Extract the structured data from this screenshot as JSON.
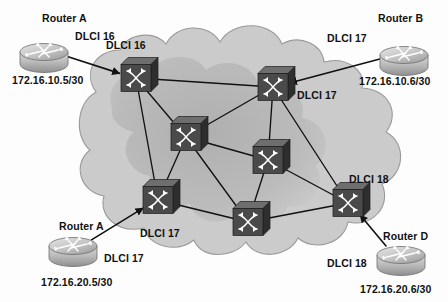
{
  "diagram": {
    "cloud": {
      "name": "frame-relay-cloud",
      "fill_outer": "#c9c9c9",
      "fill_inner": "#a8a8a8",
      "stroke": "#8d8d8d"
    },
    "colors": {
      "switch_face": "#4a4a4a",
      "switch_top": "#6e6e6e",
      "switch_side": "#2e2e2e",
      "switch_glyph": "#ffffff",
      "router_body": "#b4b4b4",
      "router_top": "#d6d6d6",
      "router_glyph": "#ffffff",
      "link": "#111111",
      "text": "#111111"
    },
    "routers": [
      {
        "id": "router-a-top",
        "name": "Router A",
        "dlci": "DLCI 16",
        "address": "172.16.10.5/30",
        "x": 44,
        "y": 52,
        "name_x": 42,
        "name_y": 13,
        "dlci_x": 75,
        "dlci_y": 31,
        "addr_x": 12,
        "addr_y": 75
      },
      {
        "id": "router-b-top",
        "name": "Router B",
        "dlci": "DLCI 17",
        "address": "172.16.10.6/30",
        "x": 404,
        "y": 55,
        "name_x": 378,
        "name_y": 13,
        "dlci_x": 327,
        "dlci_y": 33,
        "addr_x": 359,
        "addr_y": 76
      },
      {
        "id": "router-a-bottom",
        "name": "Router A",
        "dlci": "DLCI 17",
        "address": "172.16.20.5/30",
        "x": 73,
        "y": 246,
        "name_x": 59,
        "name_y": 221,
        "dlci_x": 104,
        "dlci_y": 253,
        "addr_x": 41,
        "addr_y": 277
      },
      {
        "id": "router-d-bottom",
        "name": "Router D",
        "dlci": "DLCI 18",
        "address": "172.16.20.6/30",
        "x": 401,
        "y": 255,
        "name_x": 383,
        "name_y": 231,
        "dlci_x": 327,
        "dlci_y": 258,
        "addr_x": 360,
        "addr_y": 284
      }
    ],
    "switches": [
      {
        "id": "switch-nw",
        "x": 136,
        "y": 78
      },
      {
        "id": "switch-ne",
        "x": 273,
        "y": 87
      },
      {
        "id": "switch-mid-left",
        "x": 186,
        "y": 137
      },
      {
        "id": "switch-mid-right",
        "x": 268,
        "y": 160
      },
      {
        "id": "switch-sw",
        "x": 158,
        "y": 200
      },
      {
        "id": "switch-s",
        "x": 248,
        "y": 222
      },
      {
        "id": "switch-se",
        "x": 348,
        "y": 203
      }
    ],
    "switch_labels": [
      {
        "id": "dlci-16-switch",
        "text": "DLCI 16",
        "x": 106,
        "y": 40
      },
      {
        "id": "dlci-17-switch-ne",
        "text": "DLCI 17",
        "x": 297,
        "y": 90
      },
      {
        "id": "dlci-17-switch-sw",
        "text": "DLCI 17",
        "x": 140,
        "y": 228
      },
      {
        "id": "dlci-18-switch-se",
        "text": "DLCI 18",
        "x": 349,
        "y": 174
      }
    ],
    "mesh_links": [
      [
        "switch-nw",
        "switch-ne"
      ],
      [
        "switch-nw",
        "switch-mid-left"
      ],
      [
        "switch-nw",
        "switch-sw"
      ],
      [
        "switch-ne",
        "switch-mid-left"
      ],
      [
        "switch-ne",
        "switch-mid-right"
      ],
      [
        "switch-ne",
        "switch-se"
      ],
      [
        "switch-mid-left",
        "switch-mid-right"
      ],
      [
        "switch-mid-left",
        "switch-sw"
      ],
      [
        "switch-mid-left",
        "switch-s"
      ],
      [
        "switch-mid-right",
        "switch-s"
      ],
      [
        "switch-mid-right",
        "switch-se"
      ],
      [
        "switch-sw",
        "switch-s"
      ],
      [
        "switch-s",
        "switch-se"
      ]
    ],
    "access_links": [
      {
        "id": "link-router-a-top",
        "from": "router-a-top",
        "to": "switch-nw"
      },
      {
        "id": "link-router-b-top",
        "from": "router-b-top",
        "to": "switch-ne"
      },
      {
        "id": "link-router-a-bottom",
        "from": "router-a-bottom",
        "to": "switch-sw"
      },
      {
        "id": "link-router-d-bottom",
        "from": "router-d-bottom",
        "to": "switch-se"
      }
    ]
  }
}
